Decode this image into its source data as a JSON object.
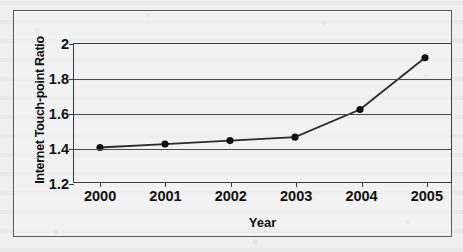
{
  "chart_data": {
    "type": "line",
    "title": "",
    "xlabel": "Year",
    "ylabel": "Internet Touch-point Ratio",
    "categories": [
      "2000",
      "2001",
      "2002",
      "2003",
      "2004",
      "2005"
    ],
    "x": [
      2000,
      2001,
      2002,
      2003,
      2004,
      2005
    ],
    "values": [
      1.4,
      1.42,
      1.44,
      1.46,
      1.62,
      1.92
    ],
    "series": [
      {
        "name": "Internet Touch-point Ratio",
        "values": [
          1.4,
          1.42,
          1.44,
          1.46,
          1.62,
          1.92
        ]
      }
    ],
    "ylim": [
      1.2,
      2.0
    ],
    "yticks": [
      "1.2",
      "1.4",
      "1.6",
      "1.8",
      "2"
    ],
    "ytick_values": [
      1.2,
      1.4,
      1.6,
      1.8,
      2.0
    ],
    "xlim": [
      1999.6,
      2005.4
    ],
    "grid": "horizontal",
    "legend": "none",
    "marker": "filled-circle",
    "line_color": "#2b2b2b",
    "marker_color": "#111111",
    "plot_border_color": "#3b3b3b",
    "gridline_color": "#4a4a4a",
    "background_color": "#efefef"
  }
}
